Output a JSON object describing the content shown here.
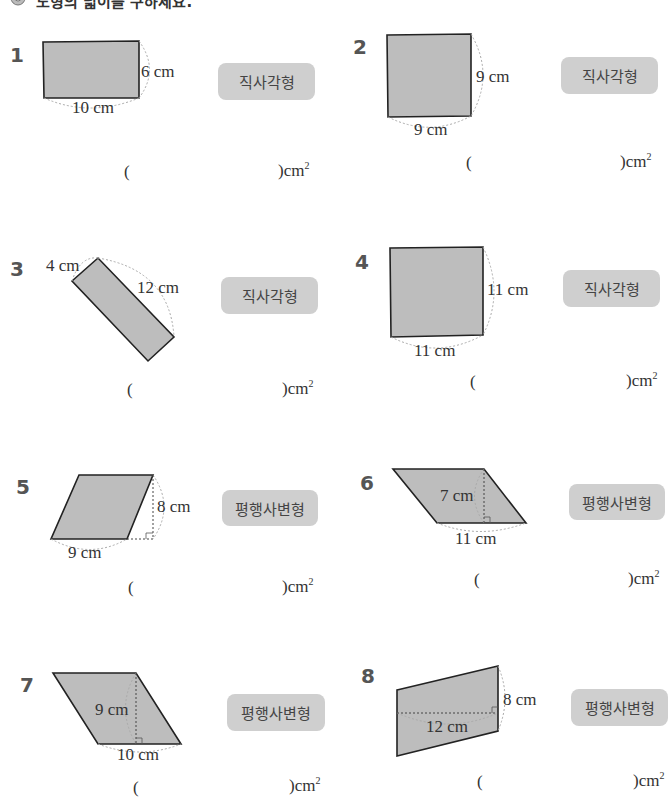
{
  "header": {
    "icon": "gear-flower-icon",
    "title": "도형의 넓이를 구하세요."
  },
  "colors": {
    "shape_fill": "#bdbdbd",
    "shape_stroke": "#222222",
    "badge_bg": "#cfcfcf",
    "dash": "#999999"
  },
  "answer": {
    "open": "(",
    "close": ")",
    "unit": "cm",
    "exp": "2"
  },
  "problems": [
    {
      "number": "1",
      "type": "직사각형",
      "labels": [
        "6 cm",
        "10 cm"
      ]
    },
    {
      "number": "2",
      "type": "직사각형",
      "labels": [
        "9 cm",
        "9 cm"
      ]
    },
    {
      "number": "3",
      "type": "직사각형",
      "labels": [
        "4 cm",
        "12 cm"
      ]
    },
    {
      "number": "4",
      "type": "직사각형",
      "labels": [
        "11 cm",
        "11 cm"
      ]
    },
    {
      "number": "5",
      "type": "평행사변형",
      "labels": [
        "8 cm",
        "9 cm"
      ]
    },
    {
      "number": "6",
      "type": "평행사변형",
      "labels": [
        "7 cm",
        "11 cm"
      ]
    },
    {
      "number": "7",
      "type": "평행사변형",
      "labels": [
        "9 cm",
        "10 cm"
      ]
    },
    {
      "number": "8",
      "type": "평행사변형",
      "labels": [
        "8 cm",
        "12 cm"
      ]
    }
  ]
}
